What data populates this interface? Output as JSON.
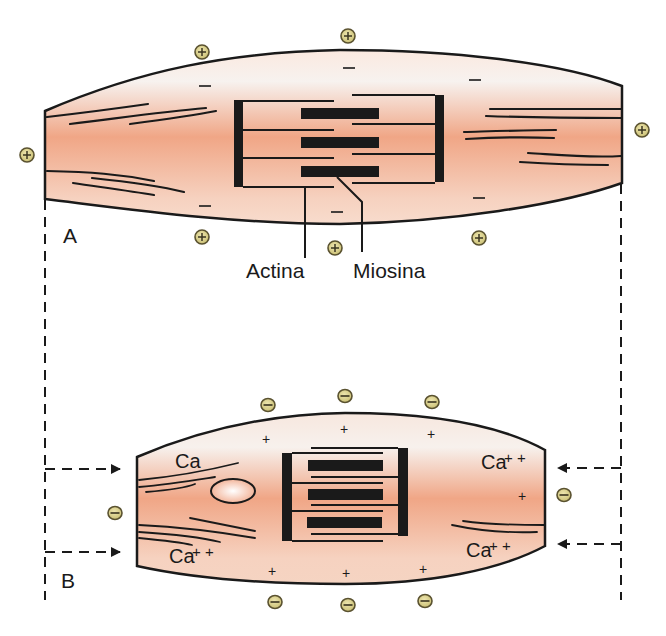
{
  "diagram": {
    "panel_a": {
      "label": "A",
      "state": "relaxed muscle cell",
      "labels": {
        "actin": "Actina",
        "myosin": "Miosina"
      },
      "outside_charge_symbol": "⊕",
      "inside_charge_symbol": "–",
      "outside_charges_count": 6,
      "inside_charges_count": 6
    },
    "panel_b": {
      "label": "B",
      "state": "contracted muscle cell",
      "labels": {
        "ca_top_left": "Ca",
        "ca_bottom_left": "Ca",
        "ca_bottom_left_sup": "+ +",
        "ca_top_right": "Ca",
        "ca_top_right_sup": "+ +",
        "ca_bottom_right": "Ca",
        "ca_bottom_right_sup": "+ +"
      },
      "outside_charge_symbol": "⊖",
      "inside_charge_symbol": "+",
      "outside_charges_count": 8,
      "inside_charges_count": 7
    },
    "colors": {
      "cell_fill_core": "#f0a888",
      "cell_fill_edge": "#fbe8de",
      "outline": "#1a1a1a",
      "charge_disk": "#d8cf8a",
      "charge_ring": "#5a5230"
    }
  }
}
